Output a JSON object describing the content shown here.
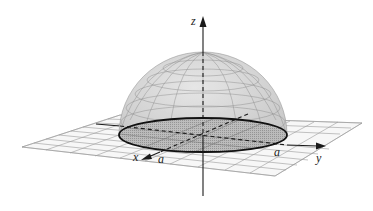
{
  "figure": {
    "type": "3d-hemisphere",
    "axes": {
      "x": {
        "label": "x",
        "tick_label": "a"
      },
      "y": {
        "label": "y",
        "tick_label": "a"
      },
      "z": {
        "label": "z"
      }
    },
    "colors": {
      "background": "#ffffff",
      "dome_fill": "#d6d6d6",
      "dome_grid": "#8a8a8a",
      "base_disk_fill": "#a9a9a9",
      "plane_grid": "#8f8f8f",
      "axis": "#1a1a1a"
    }
  }
}
